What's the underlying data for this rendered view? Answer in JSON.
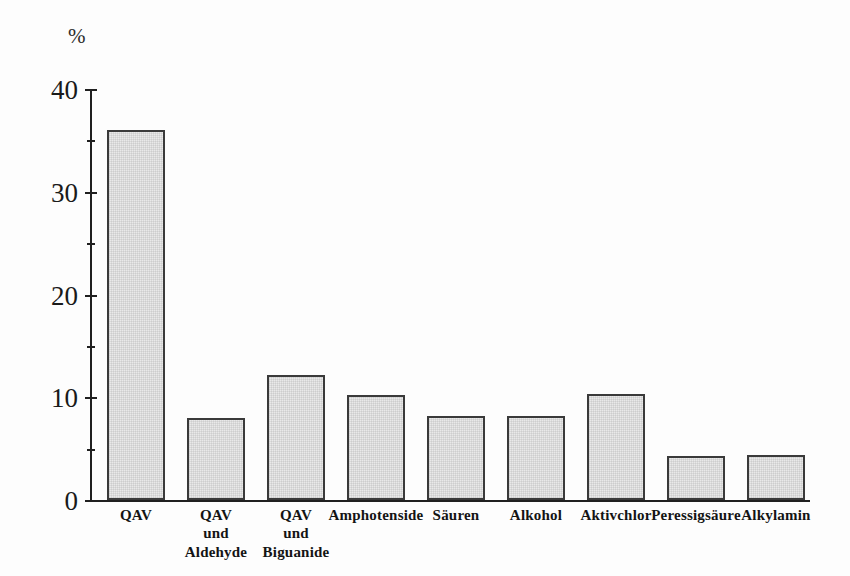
{
  "chart_data": {
    "type": "bar",
    "title": "",
    "subtitle": "",
    "xlabel": "",
    "ylabel": "%",
    "ylim": [
      0,
      40
    ],
    "y_major_ticks": [
      0,
      10,
      20,
      30,
      40
    ],
    "y_minor_ticks": [
      5,
      15,
      25,
      35
    ],
    "y_tick_labels": [
      "0",
      "10",
      "20",
      "30",
      "40"
    ],
    "grid": false,
    "legend": false,
    "legend_position": "none",
    "categories": [
      "QAV",
      "QAV\nund\nAldehyde",
      "QAV\nund\nBiguanide",
      "Amphotenside",
      "Säuren",
      "Alkohol",
      "Aktivchlor",
      "Peressigsäure",
      "Alkylamin"
    ],
    "values": [
      36,
      8,
      12.2,
      10.2,
      8.2,
      8.2,
      10.3,
      4.3,
      4.4
    ],
    "bar_fill_color": "#e9e9e9",
    "bar_edge_color": "#3a3a3a",
    "axis_color": "#202020",
    "background_color": "#fdfdfd"
  },
  "axis": {
    "unit_label": "%"
  }
}
